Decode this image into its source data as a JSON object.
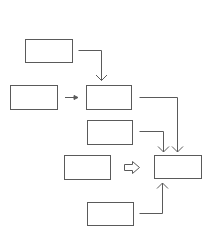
{
  "diagram": {
    "stroke_color": "#5a5a5a",
    "background": "#ffffff",
    "boxes": [
      {
        "id": "box-1",
        "x": 25,
        "y": 39,
        "w": 47,
        "h": 23,
        "label": ""
      },
      {
        "id": "box-2",
        "x": 10,
        "y": 85,
        "w": 47,
        "h": 24,
        "label": ""
      },
      {
        "id": "box-3",
        "x": 86,
        "y": 85,
        "w": 45,
        "h": 24,
        "label": ""
      },
      {
        "id": "box-4",
        "x": 87,
        "y": 120,
        "w": 45,
        "h": 24,
        "label": ""
      },
      {
        "id": "box-5",
        "x": 64,
        "y": 155,
        "w": 46,
        "h": 24,
        "label": ""
      },
      {
        "id": "box-6",
        "x": 154,
        "y": 155,
        "w": 47,
        "h": 23,
        "label": ""
      },
      {
        "id": "box-7",
        "x": 87,
        "y": 202,
        "w": 46,
        "h": 23,
        "label": ""
      }
    ],
    "connectors": [
      {
        "id": "box1-to-box3",
        "type": "elbow-arrow",
        "from": "box-1",
        "to": "box-3"
      },
      {
        "id": "box2-to-box3",
        "type": "short-arrow",
        "from": "box-2",
        "to": "box-3"
      },
      {
        "id": "box3-to-box6",
        "type": "elbow-arrow",
        "from": "box-3",
        "to": "box-6"
      },
      {
        "id": "box4-to-box6",
        "type": "elbow-arrow",
        "from": "box-4",
        "to": "box-6"
      },
      {
        "id": "box5-to-box6",
        "type": "hollow-block-arrow",
        "from": "box-5",
        "to": "box-6"
      },
      {
        "id": "box7-to-box6",
        "type": "elbow-arrow",
        "from": "box-7",
        "to": "box-6"
      }
    ]
  }
}
